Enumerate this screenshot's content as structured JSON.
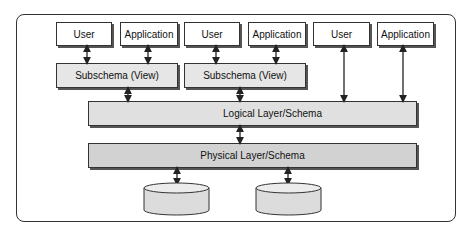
{
  "diagram": {
    "external_level": {
      "groups": [
        {
          "user_label": "User",
          "application_label": "Application",
          "subschema_label": "Subschema (View)"
        },
        {
          "user_label": "User",
          "application_label": "Application",
          "subschema_label": "Subschema (View)"
        },
        {
          "user_label": "User",
          "application_label": "Application"
        }
      ]
    },
    "logical_layer_label": "Logical Layer/Schema",
    "physical_layer_label": "Physical Layer/Schema",
    "storage": [
      {
        "name": "database-1"
      },
      {
        "name": "database-2"
      }
    ],
    "colors": {
      "border": "#333333",
      "box_fill": "#ffffff",
      "subschema_fill": "#e6e6e6",
      "logical_fill": "#e0e0e0",
      "physical_fill": "#d2d2d2",
      "cylinder_fill": "#dcdcdc"
    }
  }
}
